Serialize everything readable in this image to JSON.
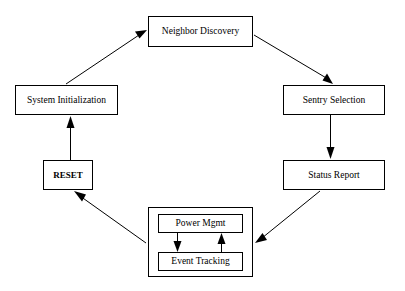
{
  "diagram": {
    "type": "flowchart-cycle",
    "title": "",
    "background_color": "#ffffff",
    "line_color": "#000000",
    "nodes": [
      {
        "id": "neighbor_discovery",
        "label": "Neighbor Discovery",
        "x": 148,
        "y": 16,
        "w": 105,
        "h": 31,
        "bold": false
      },
      {
        "id": "system_initialization",
        "label": "System Initialization",
        "x": 15,
        "y": 85,
        "w": 103,
        "h": 30,
        "bold": false
      },
      {
        "id": "sentry_selection",
        "label": "Sentry Selection",
        "x": 283,
        "y": 85,
        "w": 102,
        "h": 30,
        "bold": false
      },
      {
        "id": "reset",
        "label": "RESET",
        "x": 43,
        "y": 160,
        "w": 50,
        "h": 30,
        "bold": true
      },
      {
        "id": "status_report",
        "label": "Status Report",
        "x": 283,
        "y": 160,
        "w": 102,
        "h": 30,
        "bold": false
      },
      {
        "id": "power_mgmt",
        "label": "Power Mgmt",
        "x": 158,
        "y": 214,
        "w": 85,
        "h": 19,
        "bold": false
      },
      {
        "id": "event_tracking",
        "label": "Event Tracking",
        "x": 158,
        "y": 252,
        "w": 85,
        "h": 19,
        "bold": false
      }
    ],
    "groups": [
      {
        "id": "node_operation_group",
        "label": "",
        "x": 148,
        "y": 207,
        "w": 105,
        "h": 70
      }
    ],
    "edges": [
      {
        "id": "edge-system-init-to-neighbor-discovery",
        "from": "system_initialization",
        "to": "neighbor_discovery",
        "kind": "diagonal",
        "arrow": "single"
      },
      {
        "id": "edge-neighbor-discovery-to-sentry-selection",
        "from": "neighbor_discovery",
        "to": "sentry_selection",
        "kind": "diagonal",
        "arrow": "single"
      },
      {
        "id": "edge-sentry-selection-to-status-report",
        "from": "sentry_selection",
        "to": "status_report",
        "kind": "vertical",
        "arrow": "single"
      },
      {
        "id": "edge-status-report-to-node-operation",
        "from": "status_report",
        "to": "node_operation_group",
        "kind": "diagonal",
        "arrow": "single"
      },
      {
        "id": "edge-node-operation-to-reset",
        "from": "node_operation_group",
        "to": "reset",
        "kind": "diagonal",
        "arrow": "single"
      },
      {
        "id": "edge-reset-to-system-init",
        "from": "reset",
        "to": "system_initialization",
        "kind": "vertical",
        "arrow": "single"
      },
      {
        "id": "edge-power-mgmt-to-event-tracking",
        "from": "power_mgmt",
        "to": "event_tracking",
        "kind": "vertical",
        "arrow": "single"
      },
      {
        "id": "edge-event-tracking-to-power-mgmt",
        "from": "event_tracking",
        "to": "power_mgmt",
        "kind": "vertical",
        "arrow": "single"
      }
    ]
  }
}
